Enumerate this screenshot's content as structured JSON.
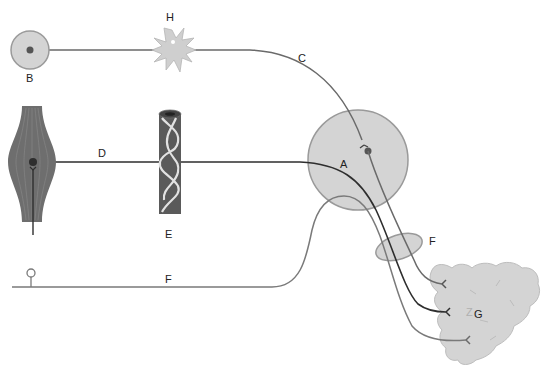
{
  "diagram": {
    "type": "anatomical-nerve-pathway",
    "colors": {
      "background": "#ffffff",
      "structure_fill": "#d4d4d4",
      "structure_stroke": "#9a9a9a",
      "nerve_dark": "#333333",
      "nerve_gray": "#7a7a7a",
      "muscle_fill": "#6e6e6e",
      "vessel_fill": "#5a5a5a",
      "vessel_wrap": "#e2e2e2",
      "neuron_dot": "#555555",
      "label_color": "#222222"
    },
    "labels": {
      "A": "A",
      "B": "B",
      "C": "C",
      "D": "D",
      "E": "E",
      "F_ganglion": "F",
      "F_nerve": "F",
      "G": "G",
      "H": "H"
    },
    "structures": [
      {
        "id": "A",
        "shape": "circle",
        "description": "large gray circular body (ganglion/nucleus) with terminal and dot"
      },
      {
        "id": "B",
        "shape": "circle",
        "description": "small gray circle with central dot"
      },
      {
        "id": "C",
        "shape": "path",
        "description": "gray curved fiber from B through H to A"
      },
      {
        "id": "D",
        "shape": "path",
        "description": "dark fiber from muscle spindle through E into A"
      },
      {
        "id": "E",
        "shape": "vessel",
        "description": "dark tube wrapped with light fibers"
      },
      {
        "id": "F",
        "shape": "ellipse",
        "description": "small gray ellipse (ganglion) crossed by fibers"
      },
      {
        "id": "F",
        "shape": "path",
        "description": "gray fiber from receptor rising to A then to gland"
      },
      {
        "id": "G",
        "shape": "gland",
        "description": "lobulated gray triangular gland receiving three terminals"
      },
      {
        "id": "H",
        "shape": "star",
        "description": "spiky gray cell on fiber C"
      }
    ]
  }
}
